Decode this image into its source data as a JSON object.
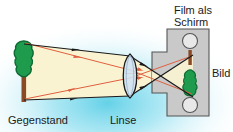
{
  "diagram": {
    "title_visible": false,
    "labels": {
      "object": "Gegenstand",
      "lens": "Linse",
      "screen_line1": "Film als",
      "screen_line2": "Schirm",
      "image": "Bild"
    },
    "colors": {
      "background_glow": "#7fd8ee",
      "background_base": "#ffffff",
      "beam_fill": "#faf3d2",
      "ray_principal": "#1a1a1a",
      "ray_secondary": "#e06040",
      "tree_crown": "#1f9b4e",
      "tree_crown_outline": "#0d6b33",
      "tree_trunk": "#8a4a26",
      "screen_body": "#c9c9c9",
      "screen_outline": "#4a4a4a",
      "lens_fill": "#cfe3f2",
      "lens_outline": "#1a1a1a",
      "text": "#1a1a1a"
    },
    "parts": {
      "object_tree": "upright green tree on left",
      "lens": "biconvex converging lens at center",
      "screen": "grey film cartridge panel on right with two sprocket circles",
      "image_tree": "inverted green tree on screen",
      "beam": "cream coloured light cone from object through lens to image",
      "rays": "two black boundary rays with arrowheads and two red secondary rays"
    },
    "sprocket_count": 2
  }
}
